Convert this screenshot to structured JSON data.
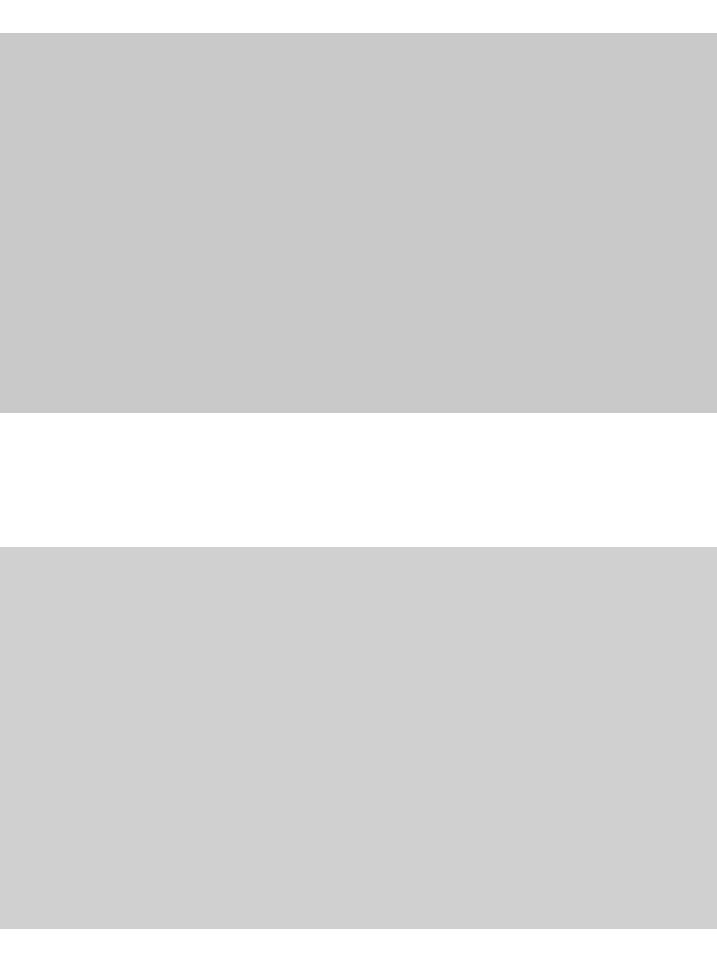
{
  "page": {
    "background": "#ffffff",
    "placeholders": [
      {
        "name": "image-placeholder-1",
        "color": "#c9c9c9"
      },
      {
        "name": "image-placeholder-2",
        "color": "#d0d0d0"
      }
    ]
  }
}
